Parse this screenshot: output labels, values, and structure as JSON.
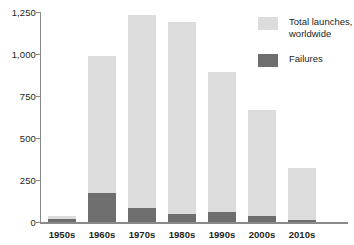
{
  "chart_data": {
    "type": "bar",
    "subtype": "stacked",
    "title": "",
    "xlabel": "",
    "ylabel": "",
    "categories": [
      "1950s",
      "1960s",
      "1970s",
      "1980s",
      "1990s",
      "2000s",
      "2010s"
    ],
    "series": [
      {
        "name": "Total launches, worldwide",
        "color": "#dcdcdc",
        "values": [
          35,
          990,
          1230,
          1190,
          895,
          665,
          320
        ]
      },
      {
        "name": "Failures",
        "color": "#6e6e6e",
        "values": [
          20,
          170,
          85,
          50,
          60,
          35,
          13
        ]
      }
    ],
    "ylim": [
      0,
      1250
    ],
    "yticks": [
      0,
      250,
      500,
      750,
      1000,
      1250
    ],
    "ytick_labels": [
      "0",
      "250",
      "500",
      "750",
      "1,000",
      "1,250"
    ],
    "grid": false,
    "legend_position": "top-right"
  },
  "legend": {
    "items": [
      {
        "label": "Total launches,\nworldwide",
        "color": "#dcdcdc"
      },
      {
        "label": "Failures",
        "color": "#6e6e6e"
      }
    ]
  }
}
